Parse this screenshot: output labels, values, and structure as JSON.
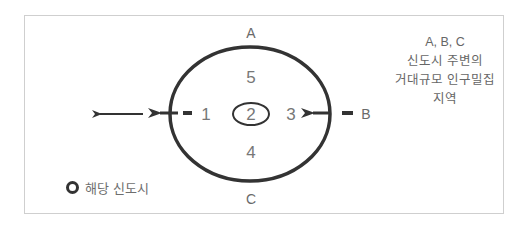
{
  "diagram": {
    "outer_labels": {
      "top": "A",
      "right": "B",
      "bottom": "C"
    },
    "zones": {
      "left": "1",
      "center": "2",
      "right": "3",
      "bottom": "4",
      "top": "5"
    },
    "note": {
      "line1": "A, B, C",
      "line2": "신도시 주변의",
      "line3": "거대규모 인구밀집지역"
    },
    "legend": {
      "label": "해당 신도시"
    },
    "colors": {
      "stroke": "#333333",
      "text": "#6a6a6a",
      "frame": "#cfcfcf"
    }
  }
}
